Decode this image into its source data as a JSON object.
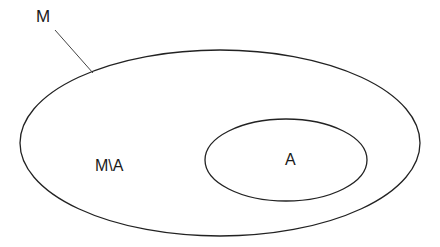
{
  "diagram": {
    "type": "venn-subset",
    "outer_set": {
      "label": "M",
      "stroke": "#222222"
    },
    "inner_set": {
      "label": "A",
      "stroke": "#222222"
    },
    "difference_region": {
      "label": "M\\A"
    },
    "background": "#ffffff"
  }
}
